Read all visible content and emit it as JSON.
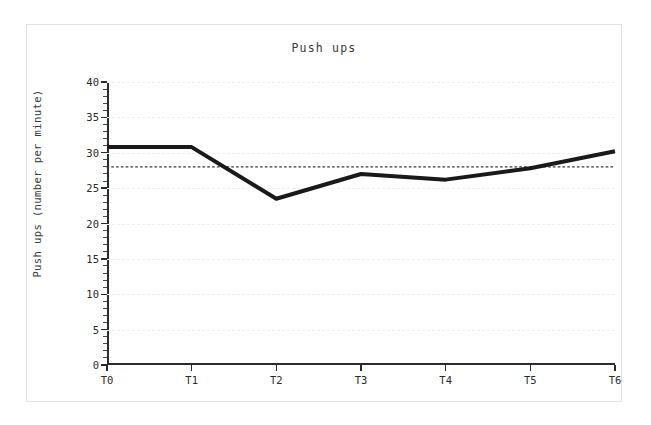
{
  "chart_data": {
    "type": "line",
    "title": "Push ups",
    "xlabel": "",
    "ylabel": "Push ups (number per minute)",
    "categories": [
      "T0",
      "T1",
      "T2",
      "T3",
      "T4",
      "T5",
      "T6"
    ],
    "values": [
      30.8,
      30.8,
      23.5,
      27.0,
      26.2,
      27.8,
      30.2
    ],
    "series": [
      {
        "name": "Push ups",
        "values": [
          30.8,
          30.8,
          23.5,
          27.0,
          26.2,
          27.8,
          30.2
        ],
        "color": "#1a1a1a",
        "style": "solid",
        "width": 4
      }
    ],
    "reference_line": {
      "name": "mean",
      "value": 28.0,
      "style": "dotted",
      "color": "#3a3a3a"
    },
    "ylim": [
      0,
      40
    ],
    "yticks": [
      0,
      5,
      10,
      15,
      20,
      25,
      30,
      35,
      40
    ],
    "ytick_labels": [
      "0",
      "5",
      "10",
      "15",
      "20",
      "25",
      "30",
      "35",
      "40"
    ],
    "yminor_step": 1,
    "xlim_categories": 7,
    "grid": true,
    "grid_axis": "y",
    "legend": false,
    "legend_position": "none",
    "background": "#ffffff",
    "frame_color": "#e2e2e2",
    "axis_color": "#2b2b2b"
  }
}
